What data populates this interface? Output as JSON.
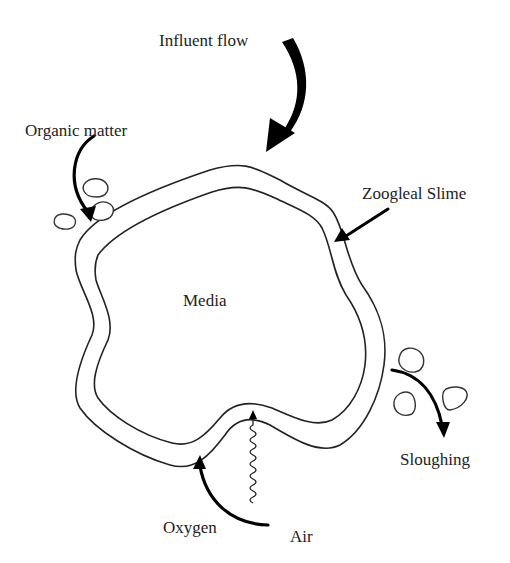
{
  "diagram": {
    "title": "",
    "labels": {
      "influent_flow": "Influent flow",
      "organic_matter": "Organic matter",
      "zoogleal_slime": "Zoogleal Slime",
      "media": "Media",
      "sloughing": "Sloughing",
      "oxygen": "Oxygen",
      "air": "Air"
    },
    "components": [
      {
        "name": "media",
        "shape": "irregular blob, inner outline"
      },
      {
        "name": "zoogleal-slime-layer",
        "shape": "band surrounding media, outer outline"
      },
      {
        "name": "organic-matter-particles",
        "count": 3
      },
      {
        "name": "sloughed-particles",
        "count": 3
      }
    ],
    "arrows": [
      {
        "from": "influent-flow-label",
        "to": "slime-layer-top",
        "style": "thick-curved"
      },
      {
        "from": "organic-matter-label",
        "to": "slime-layer-upper-left",
        "style": "curved"
      },
      {
        "from": "zoogleal-slime-label",
        "to": "slime-layer-right",
        "style": "straight"
      },
      {
        "from": "slime-layer-right",
        "to": "sloughing-label",
        "style": "curved"
      },
      {
        "from": "air-label",
        "to": "slime-layer-bottom",
        "style": "curved"
      },
      {
        "from": "air-wave",
        "to": "media-bottom",
        "style": "wavy"
      }
    ],
    "colors": {
      "line": "#222222",
      "arrow": "#000000",
      "background": "#ffffff"
    }
  }
}
